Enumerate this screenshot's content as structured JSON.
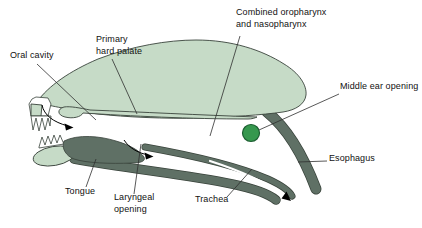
{
  "figure": {
    "type": "anatomical-diagram",
    "labels": {
      "oral_cavity": "Oral cavity",
      "primary_hard_palate_line1": "Primary",
      "primary_hard_palate_line2": "hard palate",
      "combined_line1": "Combined oropharynx",
      "combined_line2": "and nasopharynx",
      "middle_ear": "Middle ear opening",
      "esophagus": "Esophagus",
      "trachea": "Trachea",
      "laryngeal_line1": "Laryngeal",
      "laryngeal_line2": "opening",
      "tongue": "Tongue"
    },
    "colors": {
      "page_bg": "#ffffff",
      "head_fill": "#c6dbc7",
      "dark_structure": "#5f7065",
      "outline": "#39433b",
      "middle_ear_fill": "#36984e",
      "middle_ear_stroke": "#1c5e31",
      "label_text": "#111111",
      "leader": "#2e2e2e"
    }
  }
}
